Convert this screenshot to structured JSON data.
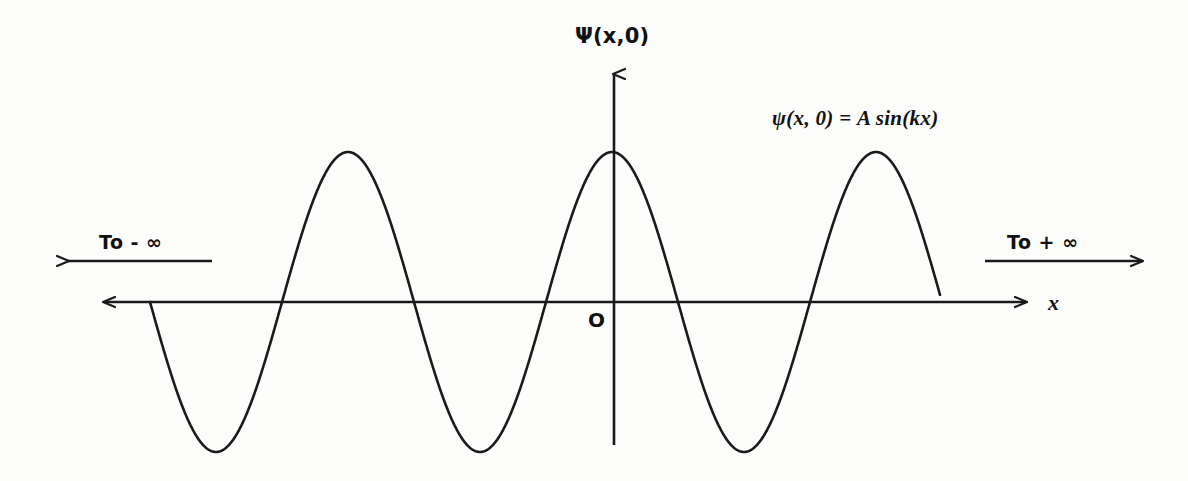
{
  "figure": {
    "background_color": "#fdfdfc",
    "stroke_color": "#1a1a1a"
  },
  "labels": {
    "y_axis": "Ψ(x,0)",
    "x_axis": "x",
    "origin": "O",
    "equation": "ψ(x, 0) = A sin(kx)",
    "to_negative_infinity": "To - ∞",
    "to_positive_infinity": "To + ∞"
  },
  "icons": {
    "y_axis_arrow": "arrow-up-icon",
    "x_axis_arrow_right": "arrow-right-icon",
    "x_axis_arrow_left": "arrow-left-icon",
    "left_extent_arrow": "arrow-left-icon",
    "right_extent_arrow": "arrow-right-icon"
  },
  "chart_data": {
    "type": "line",
    "title": "ψ(x, 0) = A sin(kx)",
    "xlabel": "x",
    "ylabel": "Ψ(x,0)",
    "grid": false,
    "legend": null,
    "annotations": [
      {
        "text": "ψ(x, 0) = A sin(kx)",
        "x_px": 772,
        "y_px": 108
      },
      {
        "text": "To - ∞",
        "x_px": 99,
        "y_px": 233
      },
      {
        "text": "To + ∞",
        "x_px": 1007,
        "y_px": 233
      },
      {
        "text": "O",
        "x_px": 588,
        "y_px": 310
      }
    ],
    "axes_geometry": {
      "origin_px": [
        614,
        302
      ],
      "x_axis_span_px": [
        95,
        1035
      ],
      "y_axis_span_px": [
        65,
        445
      ]
    },
    "curve": {
      "equation": "y = -A sin(k (x - x0))",
      "amplitude_px": 150,
      "period_px": 264,
      "wavenumber_k_rad_per_px": 0.0238,
      "x_start_px": 150,
      "x_end_px": 940,
      "baseline_y_px": 302,
      "zero_crossings_px": [
        150,
        284,
        416,
        548,
        680,
        812,
        940
      ],
      "peaks_px": [
        [
          348,
          152
        ],
        [
          614,
          152
        ],
        [
          878,
          152
        ]
      ],
      "troughs_px": [
        [
          220,
          452
        ],
        [
          483,
          452
        ],
        [
          748,
          452
        ]
      ],
      "cycles_shown": 3
    },
    "extent_arrows": [
      {
        "name": "to-negative-infinity",
        "direction": "left",
        "x_from_px": 210,
        "x_to_px": 60,
        "y_px": 261
      },
      {
        "name": "to-positive-infinity",
        "direction": "right",
        "x_from_px": 985,
        "x_to_px": 1150,
        "y_px": 261
      }
    ]
  }
}
